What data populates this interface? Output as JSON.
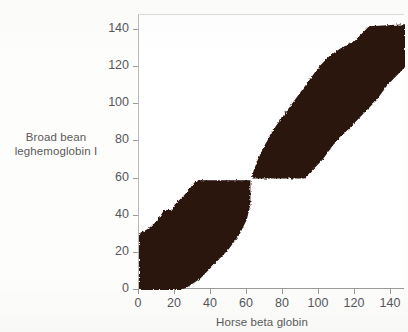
{
  "chart_data": {
    "type": "scatter",
    "plot_style": "dot-matrix-similarity-plot",
    "title": "",
    "xlabel": "Horse beta globin",
    "ylabel_lines": [
      "Broad bean",
      "leghemoglobin I"
    ],
    "ylabel": "Broad bean leghemoglobin I",
    "xlim": [
      0,
      148
    ],
    "ylim": [
      0,
      148
    ],
    "xticks": [
      0,
      20,
      40,
      60,
      80,
      100,
      120,
      140
    ],
    "yticks": [
      0,
      20,
      40,
      60,
      80,
      100,
      120,
      140
    ],
    "xtick_labels": [
      "0",
      "20",
      "40",
      "60",
      "80",
      "100",
      "120",
      "140"
    ],
    "ytick_labels": [
      "0",
      "20",
      "40",
      "60",
      "80",
      "100",
      "120",
      "140"
    ],
    "grid": false,
    "legend": false,
    "fill_color": "#2a1310",
    "axis_color": "#9a9a9a",
    "text_color": "#56565a",
    "background": "#ffffff",
    "bands": [
      {
        "name": "lower-left-band",
        "x_start": 0,
        "x_end": 92,
        "y_start": 0,
        "y_end": 60,
        "upper_edge": [
          [
            0,
            30
          ],
          [
            5,
            33
          ],
          [
            10,
            37
          ],
          [
            14,
            43
          ],
          [
            18,
            43
          ],
          [
            20,
            46
          ],
          [
            26,
            52
          ],
          [
            31,
            58
          ],
          [
            34,
            59
          ],
          [
            62,
            59
          ],
          [
            62,
            60
          ]
        ],
        "lower_edge": [
          [
            0,
            0
          ],
          [
            22,
            0
          ],
          [
            26,
            1
          ],
          [
            34,
            6
          ],
          [
            42,
            14
          ],
          [
            50,
            22
          ],
          [
            56,
            30
          ],
          [
            60,
            38
          ],
          [
            62,
            46
          ],
          [
            62,
            59
          ]
        ]
      },
      {
        "name": "upper-right-band",
        "x_start": 62,
        "x_end": 148,
        "y_start": 60,
        "y_end": 143,
        "upper_edge": [
          [
            63,
            62
          ],
          [
            66,
            70
          ],
          [
            70,
            78
          ],
          [
            76,
            88
          ],
          [
            82,
            96
          ],
          [
            88,
            104
          ],
          [
            94,
            112
          ],
          [
            100,
            120
          ],
          [
            106,
            126
          ],
          [
            112,
            130
          ],
          [
            120,
            134
          ],
          [
            128,
            142
          ],
          [
            148,
            143
          ]
        ],
        "lower_edge": [
          [
            63,
            60
          ],
          [
            92,
            60
          ],
          [
            96,
            64
          ],
          [
            102,
            70
          ],
          [
            108,
            78
          ],
          [
            114,
            84
          ],
          [
            120,
            90
          ],
          [
            126,
            96
          ],
          [
            132,
            102
          ],
          [
            138,
            110
          ],
          [
            144,
            116
          ],
          [
            148,
            120
          ]
        ]
      }
    ]
  },
  "axis": {
    "x_title": "Horse beta globin",
    "y_title_line1": "Broad bean",
    "y_title_line2": "leghemoglobin I"
  }
}
